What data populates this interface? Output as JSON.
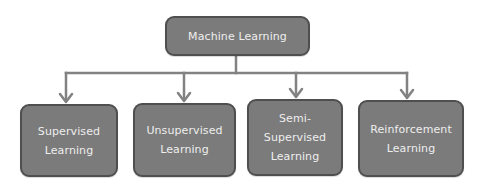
{
  "diagram": {
    "type": "hierarchy",
    "root": {
      "label": "Machine Learning"
    },
    "children": [
      {
        "label": "Supervised\nLearning"
      },
      {
        "label": "Unsupervised\nLearning"
      },
      {
        "label": "Semi-\nSupervised\nLearning"
      },
      {
        "label": "Reinforcement\nLearning"
      }
    ],
    "edges": [
      {
        "from": "Machine Learning",
        "to": "Supervised Learning"
      },
      {
        "from": "Machine Learning",
        "to": "Unsupervised Learning"
      },
      {
        "from": "Machine Learning",
        "to": "Semi-Supervised Learning"
      },
      {
        "from": "Machine Learning",
        "to": "Reinforcement Learning"
      }
    ],
    "colors": {
      "node_fill": "#7b7b7b",
      "node_border": "#4f4f4f",
      "node_text": "#eeeeee",
      "connector": "#828282",
      "background": "#ffffff"
    }
  }
}
